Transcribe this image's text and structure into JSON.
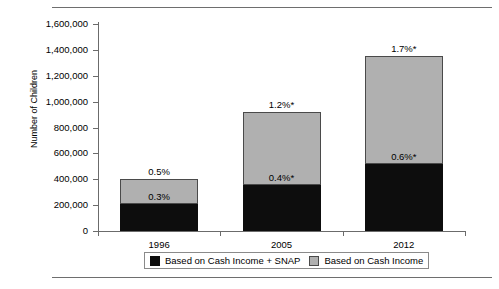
{
  "chart_data": {
    "type": "bar",
    "title": "",
    "xlabel": "",
    "ylabel": "Number of Children",
    "categories": [
      "1996",
      "2005",
      "2012"
    ],
    "ylim": [
      0,
      1600000
    ],
    "ytick_values": [
      0,
      200000,
      400000,
      600000,
      800000,
      1000000,
      1200000,
      1400000,
      1600000
    ],
    "ytick_labels": [
      "0",
      "200,000",
      "400,000",
      "600,000",
      "800,000",
      "1,000,000",
      "1,200,000",
      "1,400,000",
      "1,600,000"
    ],
    "grid": false,
    "stacked": true,
    "legend_position": "bottom",
    "series": [
      {
        "name": "Based on Cash Income + SNAP",
        "color": "#0d0d0d",
        "values": [
          205000,
          355000,
          520000
        ],
        "point_labels": [
          "0.3%",
          "0.4%*",
          "0.6%*"
        ]
      },
      {
        "name": "Based on Cash Income",
        "color": "#b0b0b0",
        "values": [
          195000,
          565000,
          835000
        ],
        "point_labels": [
          "",
          "",
          ""
        ]
      }
    ],
    "totals": [
      400000,
      920000,
      1355000
    ],
    "total_labels": [
      "0.5%",
      "1.2%*",
      "1.7%*"
    ],
    "annotations": [
      {
        "category": "1996",
        "above_bar": "0.5%",
        "inside_bar": "0.3%"
      },
      {
        "category": "2005",
        "above_bar": "1.2%*",
        "inside_bar": "0.4%*"
      },
      {
        "category": "2012",
        "above_bar": "1.7%*",
        "inside_bar": "0.6%*"
      }
    ]
  },
  "legend": {
    "items": [
      {
        "label": "Based on Cash Income + SNAP",
        "swatch": "black"
      },
      {
        "label": "Based on Cash Income",
        "swatch": "gray"
      }
    ]
  },
  "colors": {
    "cash_plus_snap": "#0d0d0d",
    "cash_income": "#b0b0b0",
    "axis": "#6b6b6b",
    "rule": "#6e6e6e"
  }
}
